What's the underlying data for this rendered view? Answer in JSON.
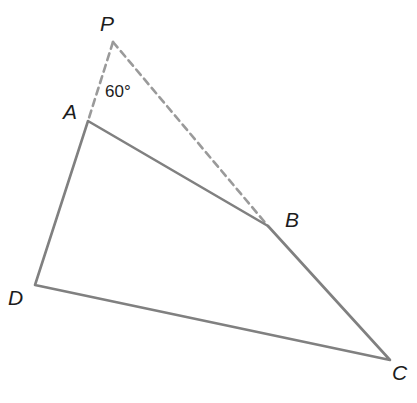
{
  "figure": {
    "type": "geometry-diagram",
    "background_color": "#ffffff",
    "canvas": {
      "width": 417,
      "height": 403
    },
    "solid_stroke_color": "#808080",
    "dashed_stroke_color": "#9a9a9a",
    "label_color": "#1c1c1c",
    "solid_stroke_width": 2.6,
    "dashed_stroke_width": 2.6,
    "dash_pattern": "7 5"
  },
  "points": {
    "P": {
      "label": "P",
      "x": 113,
      "y": 42,
      "label_x": 100,
      "label_y": 31
    },
    "A": {
      "label": "A",
      "x": 88,
      "y": 121,
      "label_x": 63,
      "label_y": 119
    },
    "B": {
      "label": "B",
      "x": 268,
      "y": 226,
      "label_x": 285,
      "label_y": 227
    },
    "C": {
      "label": "C",
      "x": 390,
      "y": 360,
      "label_x": 392,
      "label_y": 380
    },
    "D": {
      "label": "D",
      "x": 35,
      "y": 285,
      "label_x": 8,
      "label_y": 305
    }
  },
  "segments": {
    "solid": [
      {
        "name": "segment-AB",
        "from": "A",
        "to": "B"
      },
      {
        "name": "segment-BC",
        "from": "B",
        "to": "C"
      },
      {
        "name": "segment-CD",
        "from": "C",
        "to": "D"
      },
      {
        "name": "segment-DA",
        "from": "D",
        "to": "A"
      }
    ],
    "dashed": [
      {
        "name": "segment-PA",
        "from": "P",
        "to": "A"
      },
      {
        "name": "segment-PB",
        "from": "P",
        "to": "B"
      }
    ]
  },
  "annotations": {
    "angle_p": {
      "text": "60°",
      "x": 105,
      "y": 97,
      "at_vertex": "P"
    }
  },
  "paths": {
    "quadrilateral": "M 88 121 L 268 226 L 390 360 L 35 285 Z",
    "dashed_pa": "M 113 42 L 88 121",
    "dashed_pb": "M 113 42 L 268 226"
  }
}
